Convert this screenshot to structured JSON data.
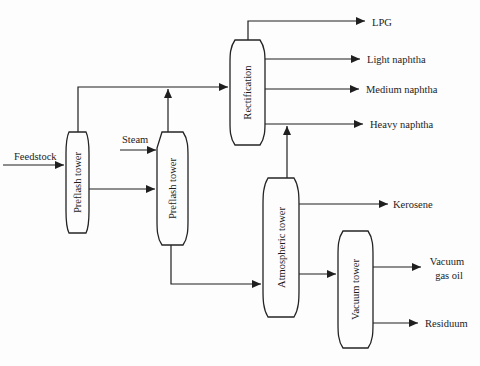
{
  "colors": {
    "line": "#1f1f1f",
    "text": "#1c1c1c",
    "background": "#fdfdfd",
    "tower_fill": "#fdfdfd"
  },
  "towers": {
    "preflash1": "Preflash tower",
    "preflash2": "Preflash tower",
    "rectification": "Rectification",
    "atmospheric": "Atmospheric tower",
    "vacuum": "Vacuum tower"
  },
  "inputs": {
    "feedstock": "Feedstock",
    "steam": "Steam"
  },
  "outputs": {
    "lpg": "LPG",
    "light_naphtha": "Light naphtha",
    "medium_naphtha": "Medium naphtha",
    "heavy_naphtha": "Heavy naphtha",
    "kerosene": "Kerosene",
    "vacuum_gas_oil": {
      "line1": "Vacuum",
      "line2": "gas oil",
      "full": "Vacuum gas oil"
    },
    "residuum": "Residuum"
  }
}
